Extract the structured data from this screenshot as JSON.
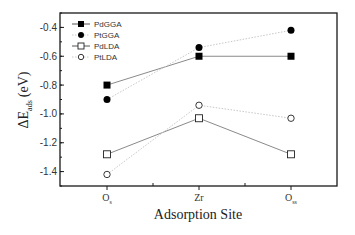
{
  "chart_data": {
    "type": "line",
    "title": "",
    "xlabel": "Adsorption Site",
    "ylabel": "ΔE_ads (eV)",
    "ylabel_parts": {
      "main": "ΔE",
      "sub": "ads",
      "unit": "(eV)"
    },
    "categories": [
      "Os",
      "Zr",
      "Oss"
    ],
    "category_labels": [
      {
        "main": "O",
        "sub": "s"
      },
      {
        "main": "Zr",
        "sub": ""
      },
      {
        "main": "O",
        "sub": "ss"
      }
    ],
    "ylim": [
      -1.5,
      -0.3
    ],
    "yticks": [
      -0.4,
      -0.6,
      -0.8,
      -1.0,
      -1.2,
      -1.4
    ],
    "ytick_labels": [
      "-0.4",
      "-0.6",
      "-0.8",
      "-1.0",
      "-1.2",
      "-1.4"
    ],
    "grid": false,
    "legend_position": "upper left",
    "series": [
      {
        "name": "PdGGA",
        "marker": "filled-square",
        "line": "solid",
        "values": [
          -0.8,
          -0.6,
          -0.6
        ]
      },
      {
        "name": "PtGGA",
        "marker": "filled-circle",
        "line": "dotted",
        "values": [
          -0.9,
          -0.54,
          -0.42
        ]
      },
      {
        "name": "PdLDA",
        "marker": "open-square",
        "line": "solid",
        "values": [
          -1.28,
          -1.03,
          -1.28
        ]
      },
      {
        "name": "PtLDA",
        "marker": "open-circle",
        "line": "dotted",
        "values": [
          -1.42,
          -0.94,
          -1.03
        ]
      }
    ]
  },
  "colors": {
    "axis": "#1a1a1a",
    "marker": "#000000",
    "solid_line": "#8a8a8a",
    "dotted_line": "#c8c8c8"
  }
}
